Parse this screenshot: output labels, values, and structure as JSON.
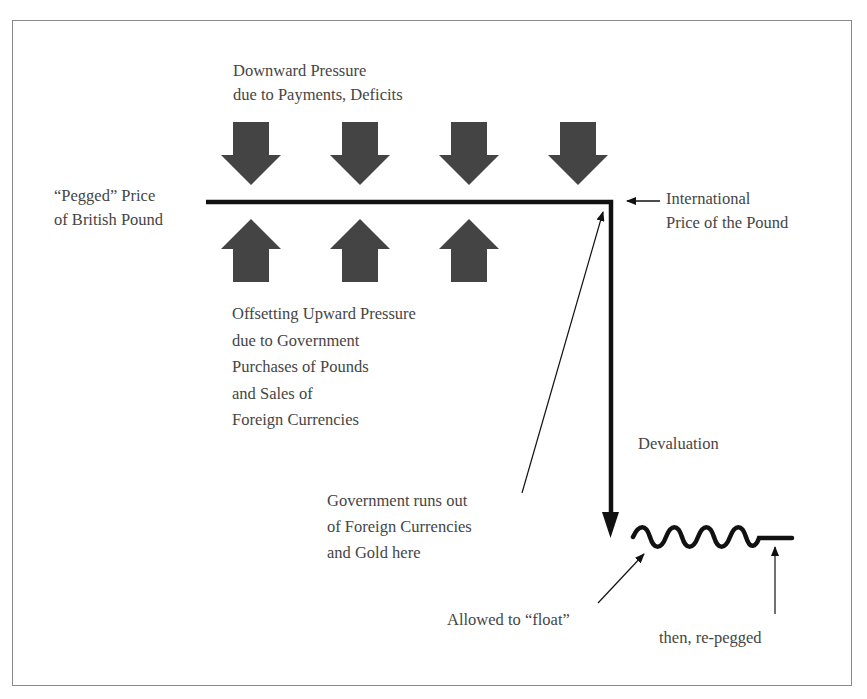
{
  "diagram": {
    "type": "pegged-exchange-rate-devaluation",
    "colors": {
      "frame": "#8a8a8a",
      "arrow_fill": "#444444",
      "line": "#111111",
      "text": "#454545"
    },
    "labels": {
      "downward_pressure": [
        "Downward Pressure",
        "due to Payments, Deficits"
      ],
      "pegged_price": [
        "“Pegged” Price",
        "of British Pound"
      ],
      "international_price": [
        "International",
        "Price of the Pound"
      ],
      "upward_pressure": [
        "Offsetting Upward Pressure",
        "due to Government",
        "Purchases of Pounds",
        "and Sales of",
        "Foreign Currencies"
      ],
      "devaluation": "Devaluation",
      "runs_out": [
        "Government runs out",
        "of Foreign Currencies",
        "and Gold here"
      ],
      "float": "Allowed to “float”",
      "repegged": "then, re-pegged"
    },
    "down_arrows_count": 4,
    "up_arrows_count": 3
  }
}
